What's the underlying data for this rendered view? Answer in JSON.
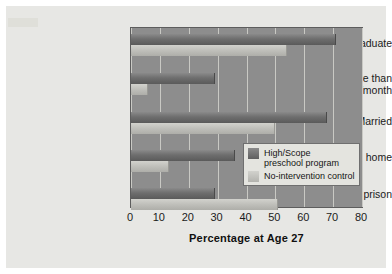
{
  "chart_data": {
    "type": "bar",
    "orientation": "horizontal",
    "title": "",
    "xlabel": "Percentage at Age 27",
    "ylabel": "",
    "xlim": [
      0,
      80
    ],
    "xticks": [
      0,
      10,
      20,
      30,
      40,
      50,
      60,
      70,
      80
    ],
    "xtick_labels": [
      "0",
      "10",
      "20",
      "30",
      "40",
      "50",
      "60",
      "70",
      "80"
    ],
    "grid": true,
    "grid_axis": "x",
    "legend_position": "center-right",
    "categories": [
      "High school graduate",
      "Earning more than $2,000/month",
      "Married",
      "Own own home",
      "Spent time in prison"
    ],
    "category_lines": [
      [
        "High school graduate"
      ],
      [
        "Earning more than",
        "$2,000/month"
      ],
      [
        "Married"
      ],
      [
        "Own own home"
      ],
      [
        "Spent time in prison"
      ]
    ],
    "series": [
      {
        "name": "High/Scope preschool program",
        "color": "#6e6e6e",
        "values": [
          71,
          29,
          68,
          36,
          29
        ]
      },
      {
        "name": "No-intervention control",
        "color": "#c4c4bf",
        "values": [
          54,
          6,
          50,
          13,
          51
        ]
      }
    ]
  },
  "legend": {
    "entries": [
      {
        "label_lines": [
          "High/Scope",
          "preschool program"
        ]
      },
      {
        "label_lines": [
          "No-intervention control"
        ]
      }
    ]
  },
  "colors": {
    "plot_background": "#8d8d8d",
    "page_background": "#e7e7e4",
    "gridline": "#c9c9c4",
    "treatment_bar": "#6e6e6e",
    "control_bar": "#c4c4bf",
    "text": "#1b1b1b"
  }
}
